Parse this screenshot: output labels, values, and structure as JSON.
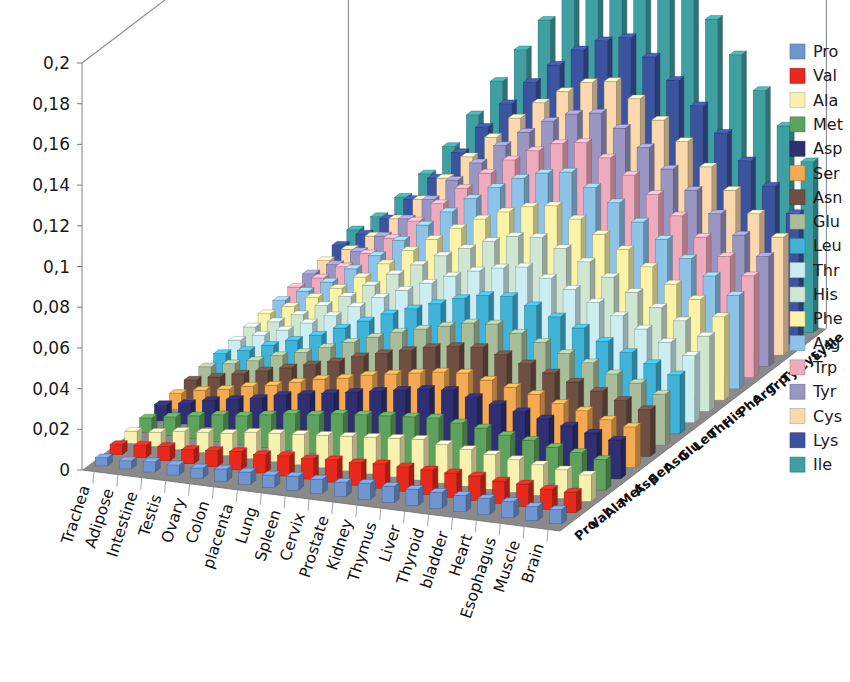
{
  "chart_data": {
    "type": "bar",
    "subtype": "3d-grouped-bar",
    "title": "",
    "xlabel": "",
    "ylabel": "",
    "zlabel": "",
    "ylim": [
      0,
      0.2
    ],
    "y_tick_labels": [
      "0",
      "0,02",
      "0,04",
      "0,06",
      "0,08",
      "0,1",
      "0,12",
      "0,14",
      "0,16",
      "0,18",
      "0,2"
    ],
    "y_tick_values": [
      0,
      0.02,
      0.04,
      0.06,
      0.08,
      0.1,
      0.12,
      0.14,
      0.16,
      0.18,
      0.2
    ],
    "decimal_separator": ",",
    "grid": true,
    "legend_position": "right",
    "categories": [
      "Trachea",
      "Adipose",
      "Intestine",
      "Testis",
      "Ovary",
      "Colon",
      "placenta",
      "Lung",
      "Spleen",
      "Cervix",
      "Prostate",
      "Kidney",
      "Thymus",
      "Liver",
      "Thyroid",
      "bladder",
      "Heart",
      "Esophagus",
      "Muscle",
      "Brain"
    ],
    "depth_categories": [
      "Pro",
      "Val",
      "Ala",
      "Met",
      "Asp",
      "Ser",
      "Asn",
      "Glu",
      "Leu",
      "Thr",
      "His",
      "Phe",
      "Arg",
      "Trp",
      "Tyr",
      "Cys",
      "Lys",
      "Ile"
    ],
    "series": [
      {
        "name": "Pro",
        "color": "#6f96d1",
        "values": [
          0.004,
          0.004,
          0.005,
          0.005,
          0.005,
          0.006,
          0.006,
          0.006,
          0.007,
          0.007,
          0.007,
          0.008,
          0.008,
          0.008,
          0.008,
          0.008,
          0.008,
          0.008,
          0.007,
          0.007
        ]
      },
      {
        "name": "Val",
        "color": "#e8291c",
        "values": [
          0.005,
          0.006,
          0.007,
          0.007,
          0.008,
          0.009,
          0.009,
          0.01,
          0.01,
          0.011,
          0.011,
          0.012,
          0.012,
          0.012,
          0.012,
          0.012,
          0.011,
          0.011,
          0.01,
          0.01
        ]
      },
      {
        "name": "Ala",
        "color": "#f7f2b0",
        "values": [
          0.006,
          0.007,
          0.009,
          0.01,
          0.011,
          0.013,
          0.014,
          0.015,
          0.016,
          0.017,
          0.018,
          0.019,
          0.02,
          0.019,
          0.018,
          0.017,
          0.016,
          0.015,
          0.014,
          0.013
        ]
      },
      {
        "name": "Met",
        "color": "#5da35e",
        "values": [
          0.007,
          0.009,
          0.011,
          0.013,
          0.014,
          0.016,
          0.018,
          0.019,
          0.021,
          0.022,
          0.023,
          0.024,
          0.025,
          0.024,
          0.023,
          0.021,
          0.02,
          0.018,
          0.017,
          0.015
        ]
      },
      {
        "name": "Asp",
        "color": "#2f2f73",
        "values": [
          0.008,
          0.01,
          0.013,
          0.015,
          0.017,
          0.02,
          0.022,
          0.024,
          0.026,
          0.028,
          0.03,
          0.032,
          0.033,
          0.031,
          0.029,
          0.027,
          0.025,
          0.023,
          0.021,
          0.019
        ]
      },
      {
        "name": "Ser",
        "color": "#f5a951",
        "values": [
          0.008,
          0.011,
          0.013,
          0.016,
          0.018,
          0.021,
          0.024,
          0.026,
          0.029,
          0.031,
          0.033,
          0.035,
          0.036,
          0.034,
          0.032,
          0.03,
          0.027,
          0.025,
          0.022,
          0.02
        ]
      },
      {
        "name": "Asn",
        "color": "#6f4f42",
        "values": [
          0.009,
          0.012,
          0.015,
          0.018,
          0.021,
          0.024,
          0.027,
          0.031,
          0.034,
          0.037,
          0.04,
          0.042,
          0.043,
          0.041,
          0.038,
          0.035,
          0.032,
          0.029,
          0.026,
          0.023
        ]
      },
      {
        "name": "Glu",
        "color": "#a9bd9b",
        "values": [
          0.01,
          0.013,
          0.016,
          0.02,
          0.023,
          0.027,
          0.031,
          0.035,
          0.039,
          0.042,
          0.045,
          0.048,
          0.049,
          0.046,
          0.043,
          0.039,
          0.036,
          0.032,
          0.029,
          0.025
        ]
      },
      {
        "name": "Leu",
        "color": "#3fb3d8",
        "values": [
          0.011,
          0.014,
          0.018,
          0.022,
          0.026,
          0.031,
          0.036,
          0.041,
          0.045,
          0.049,
          0.053,
          0.056,
          0.057,
          0.054,
          0.05,
          0.046,
          0.041,
          0.037,
          0.033,
          0.029
        ]
      },
      {
        "name": "Thr",
        "color": "#cceef2",
        "values": [
          0.012,
          0.016,
          0.02,
          0.025,
          0.03,
          0.036,
          0.042,
          0.047,
          0.052,
          0.057,
          0.061,
          0.064,
          0.066,
          0.062,
          0.058,
          0.053,
          0.048,
          0.043,
          0.038,
          0.033
        ]
      },
      {
        "name": "His",
        "color": "#cfe6d3",
        "values": [
          0.013,
          0.017,
          0.022,
          0.028,
          0.034,
          0.041,
          0.048,
          0.054,
          0.06,
          0.065,
          0.07,
          0.074,
          0.075,
          0.071,
          0.066,
          0.06,
          0.054,
          0.048,
          0.043,
          0.037
        ]
      },
      {
        "name": "Phe",
        "color": "#faf3a8",
        "values": [
          0.014,
          0.019,
          0.025,
          0.031,
          0.038,
          0.046,
          0.054,
          0.061,
          0.068,
          0.074,
          0.079,
          0.083,
          0.085,
          0.08,
          0.074,
          0.068,
          0.061,
          0.054,
          0.048,
          0.041
        ]
      },
      {
        "name": "Arg",
        "color": "#8dc3e8",
        "values": [
          0.015,
          0.021,
          0.027,
          0.035,
          0.043,
          0.052,
          0.061,
          0.069,
          0.077,
          0.084,
          0.09,
          0.094,
          0.096,
          0.09,
          0.084,
          0.076,
          0.069,
          0.061,
          0.054,
          0.046
        ]
      },
      {
        "name": "Trp",
        "color": "#efaabc",
        "values": [
          0.016,
          0.022,
          0.029,
          0.037,
          0.046,
          0.056,
          0.066,
          0.075,
          0.084,
          0.092,
          0.098,
          0.103,
          0.105,
          0.099,
          0.092,
          0.084,
          0.075,
          0.066,
          0.058,
          0.05
        ]
      },
      {
        "name": "Tyr",
        "color": "#9a96c4",
        "values": [
          0.017,
          0.023,
          0.031,
          0.04,
          0.05,
          0.061,
          0.072,
          0.082,
          0.092,
          0.1,
          0.107,
          0.112,
          0.114,
          0.108,
          0.1,
          0.091,
          0.082,
          0.072,
          0.063,
          0.054
        ]
      },
      {
        "name": "Cys",
        "color": "#fbd8ad",
        "values": [
          0.018,
          0.025,
          0.033,
          0.043,
          0.054,
          0.066,
          0.078,
          0.089,
          0.1,
          0.109,
          0.116,
          0.122,
          0.124,
          0.117,
          0.108,
          0.099,
          0.088,
          0.078,
          0.068,
          0.058
        ]
      },
      {
        "name": "Lys",
        "color": "#3b54a0",
        "values": [
          0.02,
          0.027,
          0.036,
          0.047,
          0.059,
          0.073,
          0.087,
          0.1,
          0.112,
          0.122,
          0.131,
          0.137,
          0.14,
          0.132,
          0.122,
          0.111,
          0.099,
          0.087,
          0.076,
          0.064
        ]
      },
      {
        "name": "Ile",
        "color": "#3fa0a3",
        "values": [
          0.022,
          0.03,
          0.041,
          0.054,
          0.069,
          0.086,
          0.104,
          0.121,
          0.137,
          0.152,
          0.166,
          0.192,
          0.232,
          0.178,
          0.163,
          0.148,
          0.132,
          0.116,
          0.1,
          0.084
        ]
      }
    ]
  },
  "legend": {
    "entries": [
      {
        "label": "Pro",
        "color": "#6f96d1"
      },
      {
        "label": "Val",
        "color": "#e8291c"
      },
      {
        "label": "Ala",
        "color": "#f7f2b0"
      },
      {
        "label": "Met",
        "color": "#5da35e"
      },
      {
        "label": "Asp",
        "color": "#2f2f73"
      },
      {
        "label": "Ser",
        "color": "#f5a951"
      },
      {
        "label": "Asn",
        "color": "#6f4f42"
      },
      {
        "label": "Glu",
        "color": "#a9bd9b"
      },
      {
        "label": "Leu",
        "color": "#3fb3d8"
      },
      {
        "label": "Thr",
        "color": "#cceef2"
      },
      {
        "label": "His",
        "color": "#cfe6d3"
      },
      {
        "label": "Phe",
        "color": "#faf3a8"
      },
      {
        "label": "Arg",
        "color": "#8dc3e8"
      },
      {
        "label": "Trp",
        "color": "#efaabc"
      },
      {
        "label": "Tyr",
        "color": "#9a96c4"
      },
      {
        "label": "Cys",
        "color": "#fbd8ad"
      },
      {
        "label": "Lys",
        "color": "#3b54a0"
      },
      {
        "label": "Ile",
        "color": "#3fa0a3"
      }
    ]
  },
  "style": {
    "floor_color": "#8a8a8a",
    "wall_color": "#ffffff",
    "gridline_color": "#c8c8c8",
    "frame_color": "#8a8a95",
    "text_color": "#1a1a1a"
  }
}
